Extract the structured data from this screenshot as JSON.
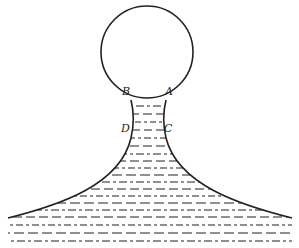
{
  "diagram": {
    "labels": {
      "a": "A",
      "b": "B",
      "c": "C",
      "d": "D"
    },
    "colors": {
      "line": "#222222",
      "background": "#ffffff"
    }
  }
}
